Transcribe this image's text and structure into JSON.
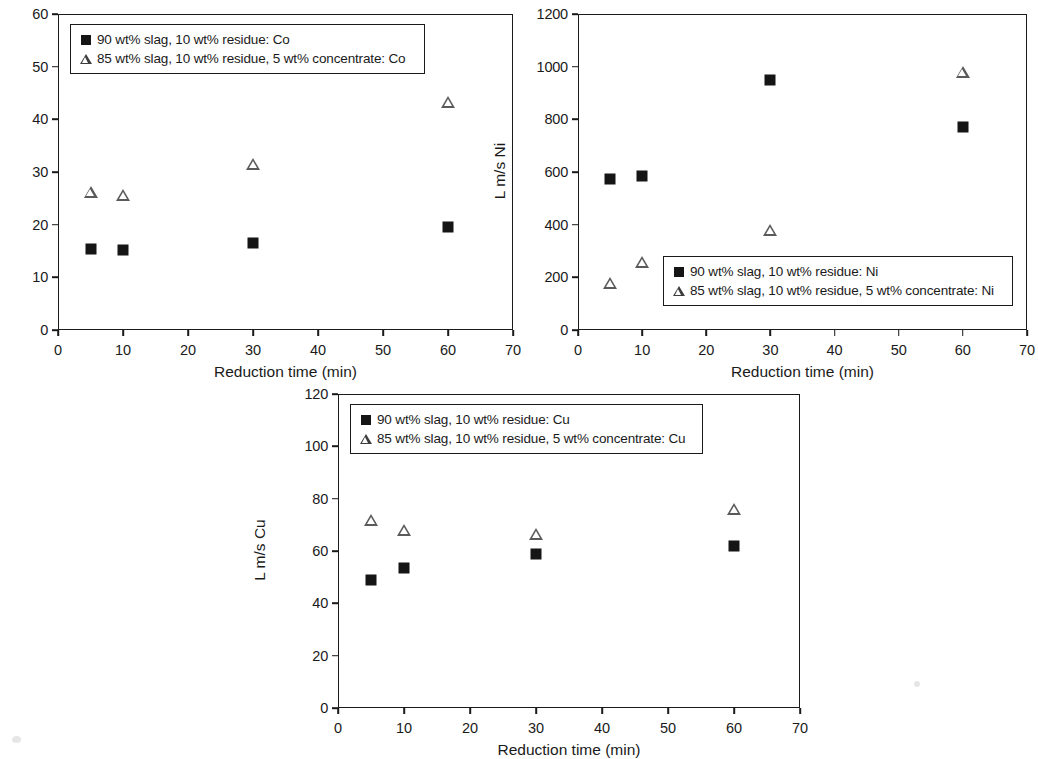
{
  "figure": {
    "background": "#ffffff",
    "marker_square_color": "#151515",
    "marker_triangle_color": "#5a5a5a",
    "axis_color": "#1a1a1a"
  },
  "panels": [
    {
      "id": "co",
      "ylabel": "L m/s Co",
      "xlabel": "Reduction time (min)",
      "yticks": [
        "0",
        "10",
        "20",
        "30",
        "40",
        "50",
        "60"
      ],
      "xticks": [
        "0",
        "10",
        "20",
        "30",
        "40",
        "50",
        "60",
        "70"
      ],
      "legend": [
        {
          "key": "square",
          "label": "90 wt% slag, 10 wt% residue: Co"
        },
        {
          "key": "triangle",
          "label": "85 wt% slag, 10 wt% residue, 5 wt% concentrate: Co"
        }
      ]
    },
    {
      "id": "ni",
      "ylabel": "L m/s Ni",
      "xlabel": "Reduction time (min)",
      "yticks": [
        "0",
        "200",
        "400",
        "600",
        "800",
        "1000",
        "1200"
      ],
      "xticks": [
        "0",
        "10",
        "20",
        "30",
        "40",
        "50",
        "60",
        "70"
      ],
      "legend": [
        {
          "key": "square",
          "label": "90 wt% slag, 10 wt% residue: Ni"
        },
        {
          "key": "triangle",
          "label": "85 wt% slag, 10 wt% residue, 5 wt% concentrate: Ni"
        }
      ]
    },
    {
      "id": "cu",
      "ylabel": "L m/s Cu",
      "xlabel": "Reduction time (min)",
      "yticks": [
        "0",
        "20",
        "40",
        "60",
        "80",
        "100",
        "120"
      ],
      "xticks": [
        "0",
        "10",
        "20",
        "30",
        "40",
        "50",
        "60",
        "70"
      ],
      "legend": [
        {
          "key": "square",
          "label": "90 wt% slag, 10 wt% residue: Cu"
        },
        {
          "key": "triangle",
          "label": "85 wt% slag, 10 wt% residue, 5 wt% concentrate: Cu"
        }
      ]
    }
  ],
  "chart_data": [
    {
      "type": "scatter",
      "id": "co",
      "title": "",
      "xlabel": "Reduction time (min)",
      "ylabel": "L m/s Co",
      "xlim": [
        0,
        70
      ],
      "ylim": [
        0,
        60
      ],
      "xticks": [
        0,
        10,
        20,
        30,
        40,
        50,
        60,
        70
      ],
      "yticks": [
        0,
        10,
        20,
        30,
        40,
        50,
        60
      ],
      "grid": false,
      "legend_position": "top-left",
      "x": [
        5,
        10,
        30,
        60
      ],
      "series": [
        {
          "name": "90 wt% slag, 10 wt% residue: Co",
          "marker": "filled-square",
          "values": [
            15.4,
            15.1,
            16.6,
            19.5
          ]
        },
        {
          "name": "85 wt% slag, 10 wt% residue, 5 wt% concentrate: Co",
          "marker": "open-triangle",
          "values": [
            26.2,
            25.7,
            31.5,
            43.3
          ]
        }
      ]
    },
    {
      "type": "scatter",
      "id": "ni",
      "title": "",
      "xlabel": "Reduction time (min)",
      "ylabel": "L m/s Ni",
      "xlim": [
        0,
        70
      ],
      "ylim": [
        0,
        1200
      ],
      "xticks": [
        0,
        10,
        20,
        30,
        40,
        50,
        60,
        70
      ],
      "yticks": [
        0,
        200,
        400,
        600,
        800,
        1000,
        1200
      ],
      "grid": false,
      "legend_position": "bottom-right",
      "x": [
        5,
        10,
        30,
        60
      ],
      "series": [
        {
          "name": "90 wt% slag, 10 wt% residue: Ni",
          "marker": "filled-square",
          "values": [
            575,
            585,
            950,
            770
          ]
        },
        {
          "name": "85 wt% slag, 10 wt% residue, 5 wt% concentrate: Ni",
          "marker": "open-triangle",
          "values": [
            180,
            260,
            380,
            980
          ]
        }
      ]
    },
    {
      "type": "scatter",
      "id": "cu",
      "title": "",
      "xlabel": "Reduction time (min)",
      "ylabel": "L m/s Cu",
      "xlim": [
        0,
        70
      ],
      "ylim": [
        0,
        120
      ],
      "xticks": [
        0,
        10,
        20,
        30,
        40,
        50,
        60,
        70
      ],
      "yticks": [
        0,
        20,
        40,
        60,
        80,
        100,
        120
      ],
      "grid": false,
      "legend_position": "top-left",
      "x": [
        5,
        10,
        30,
        60
      ],
      "series": [
        {
          "name": "90 wt% slag, 10 wt% residue: Cu",
          "marker": "filled-square",
          "values": [
            49,
            53.5,
            59,
            62
          ]
        },
        {
          "name": "85 wt% slag, 10 wt% residue, 5 wt% concentrate: Cu",
          "marker": "open-triangle",
          "values": [
            72,
            68,
            66.5,
            76
          ]
        }
      ]
    }
  ]
}
